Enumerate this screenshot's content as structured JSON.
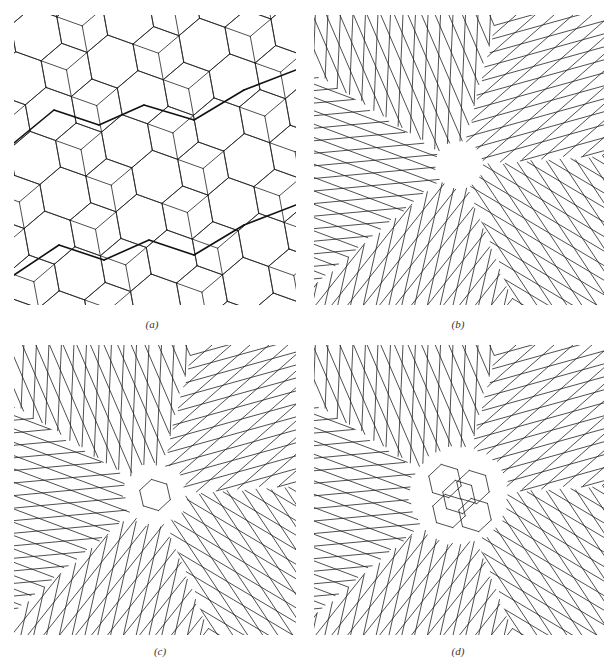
{
  "figure": {
    "background": "#ffffff",
    "line_color": "#222222",
    "panels": [
      {
        "id": "a",
        "caption": "(a)",
        "description": "Tiling of rhombi and hexagon-like cells (pentagonal/hexagonal rings), with several bold zig-zag paths running diagonally",
        "box": {
          "x": 14,
          "y": 15,
          "w": 282,
          "h": 290
        },
        "caption_pos": {
          "x": 112,
          "y": 318
        }
      },
      {
        "id": "b",
        "caption": "(b)",
        "description": "Rhombic chevron tiling with a pinwheel (vortex) defect at the center — small void",
        "box": {
          "x": 314,
          "y": 15,
          "w": 290,
          "h": 290
        },
        "caption_pos": {
          "x": 418,
          "y": 318
        }
      },
      {
        "id": "c",
        "caption": "(c)",
        "description": "Rhombic chevron tiling with a pinwheel defect enclosing a small hexagonal cell pair at the center",
        "box": {
          "x": 14,
          "y": 345,
          "w": 282,
          "h": 290
        },
        "caption_pos": {
          "x": 120,
          "y": 645
        }
      },
      {
        "id": "d",
        "caption": "(d)",
        "description": "Rhombic chevron tiling with a larger central defect region containing several hexagonal cells",
        "box": {
          "x": 314,
          "y": 345,
          "w": 290,
          "h": 290
        },
        "caption_pos": {
          "x": 418,
          "y": 645
        }
      }
    ]
  }
}
